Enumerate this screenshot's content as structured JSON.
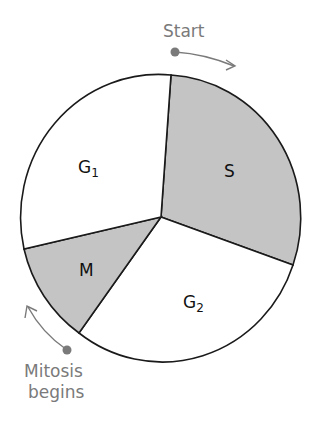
{
  "diagram": {
    "colors": {
      "shaded": "#c4c4c4",
      "unshaded": "#ffffff",
      "outline": "#1a1a1a",
      "annotation": "#7a7a7a"
    },
    "phases": [
      {
        "name": "G1",
        "label_main": "G",
        "label_sub": "1",
        "shaded": false
      },
      {
        "name": "S",
        "label_main": "S",
        "label_sub": "",
        "shaded": true
      },
      {
        "name": "G2",
        "label_main": "G",
        "label_sub": "2",
        "shaded": false
      },
      {
        "name": "M",
        "label_main": "M",
        "label_sub": "",
        "shaded": true
      }
    ],
    "annotations": {
      "start": "Start",
      "mitosis_line1": "Mitosis",
      "mitosis_line2": "begins"
    }
  }
}
